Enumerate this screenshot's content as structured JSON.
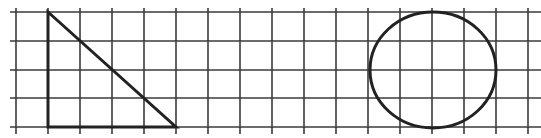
{
  "diagram": {
    "type": "grid-shapes",
    "background": "#ffffff",
    "grid": {
      "color": "#3a3a3a",
      "line_width": 1.6,
      "vertical_lines_x": [
        16,
        48,
        80,
        112,
        144,
        176,
        208,
        240,
        272,
        304,
        336,
        368,
        400,
        432,
        464,
        496,
        528
      ],
      "horizontal_lines_y": [
        12,
        41,
        70,
        98,
        127
      ],
      "h_extent": [
        10,
        541
      ],
      "v_extent": [
        8,
        134
      ]
    },
    "shapes": [
      {
        "name": "right-triangle",
        "kind": "polygon",
        "stroke": "#222222",
        "stroke_width": 3,
        "points": [
          [
            48,
            12
          ],
          [
            48,
            127
          ],
          [
            176,
            127
          ]
        ]
      },
      {
        "name": "circle",
        "kind": "ellipse",
        "stroke": "#222222",
        "stroke_width": 3,
        "cx": 433,
        "cy": 70,
        "rx": 63,
        "ry": 58
      }
    ]
  }
}
